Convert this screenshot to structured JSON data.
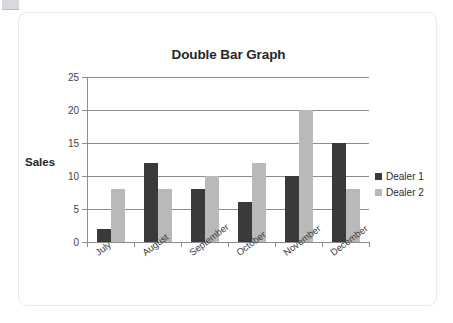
{
  "card": {
    "name": "chart-card"
  },
  "chart_data": {
    "type": "bar",
    "title": "Double Bar Graph",
    "xlabel": "",
    "ylabel": "Sales",
    "categories": [
      "July",
      "August",
      "September",
      "October",
      "November",
      "December"
    ],
    "series": [
      {
        "name": "Dealer 1",
        "color": "#3a3a3c",
        "values": [
          2,
          12,
          8,
          6,
          10,
          15
        ]
      },
      {
        "name": "Dealer 2",
        "color": "#b9b9b9",
        "values": [
          8,
          8,
          10,
          12,
          20,
          8
        ]
      }
    ],
    "ylim": [
      0,
      25
    ],
    "yticks": [
      0,
      5,
      10,
      15,
      20,
      25
    ],
    "ytick_labels": [
      "0",
      "5",
      "10",
      "15",
      "20",
      "25"
    ],
    "grid": true,
    "legend_position": "right",
    "orientation": "vertical",
    "grouping": "grouped"
  }
}
